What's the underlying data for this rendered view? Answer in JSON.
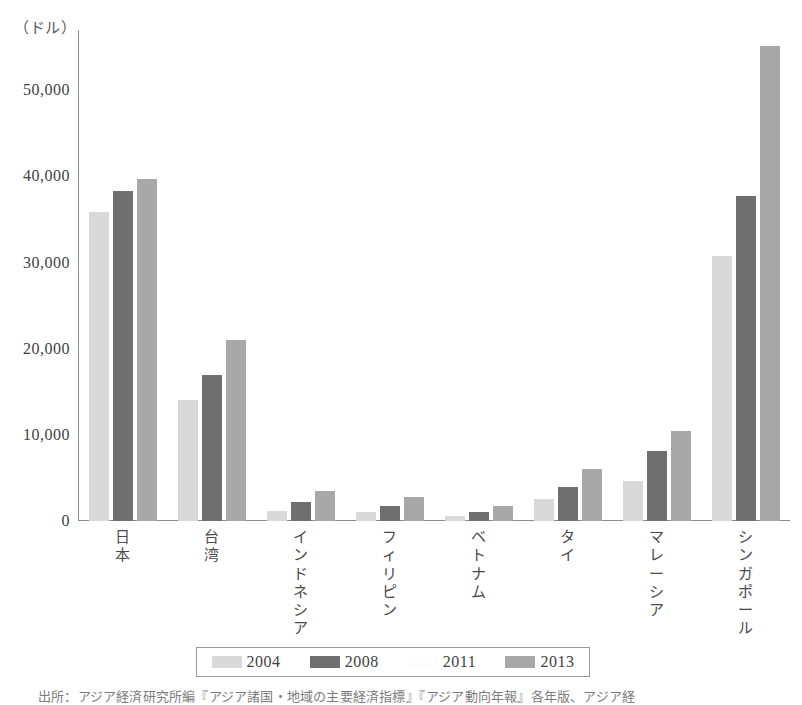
{
  "unit_caption": "（ドル）",
  "source_note": "出所：アジア経済研究所編『アジア諸国・地域の主要経済指標』『アジア動向年報』各年版、アジア経",
  "legend": {
    "items": [
      {
        "label": "2004",
        "color": "#d9d9d9"
      },
      {
        "label": "2008",
        "color": "#6f6f6f"
      },
      {
        "label": "2011",
        "color": "#fdfdfd"
      },
      {
        "label": "2013",
        "color": "#a8a8a8"
      }
    ]
  },
  "chart_data": {
    "type": "bar",
    "title": "",
    "xlabel": "",
    "ylabel": "（ドル）",
    "ylim": [
      0,
      55000
    ],
    "axis_max_plot": 57000,
    "yticks": [
      0,
      10000,
      20000,
      30000,
      40000,
      50000
    ],
    "ytick_labels": [
      "0",
      "10,000",
      "20,000",
      "30,000",
      "40,000",
      "50,000"
    ],
    "grid": false,
    "legend_position": "bottom",
    "categories": [
      "日本",
      "台湾",
      "インドネシア",
      "フィリピン",
      "ベトナム",
      "タイ",
      "マレーシア",
      "シンガポール"
    ],
    "category_chars": [
      [
        "日",
        "本"
      ],
      [
        "台",
        "湾"
      ],
      [
        "イ",
        "ン",
        "ド",
        "ネ",
        "シ",
        "ア"
      ],
      [
        "フ",
        "ィ",
        "リ",
        "ピ",
        "ン"
      ],
      [
        "ベ",
        "ト",
        "ナ",
        "ム"
      ],
      [
        "タ",
        "イ"
      ],
      [
        "マ",
        "レ",
        "ー",
        "シ",
        "ア"
      ],
      [
        "シ",
        "ン",
        "ガ",
        "ポ",
        "ー",
        "ル"
      ]
    ],
    "series": [
      {
        "name": "2004",
        "color": "#d9d9d9",
        "values": [
          35900,
          14000,
          1200,
          1000,
          600,
          2500,
          4700,
          30800
        ]
      },
      {
        "name": "2008",
        "color": "#6f6f6f",
        "values": [
          38300,
          16900,
          2200,
          1800,
          1000,
          4000,
          8100,
          37700
        ]
      },
      {
        "name": "2013",
        "color": "#a8a8a8",
        "values": [
          39700,
          21000,
          3500,
          2800,
          1800,
          6000,
          10500,
          55200
        ]
      }
    ]
  }
}
